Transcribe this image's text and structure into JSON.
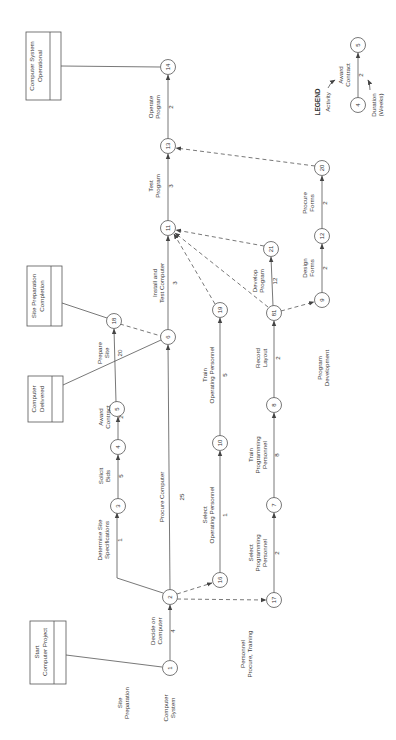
{
  "diagram": {
    "type": "PERT network (rotated 90°)",
    "legend": {
      "title": "LEGEND",
      "activity_label": "Activity",
      "duration_label": "Duration",
      "duration_unit": "(Weeks)",
      "example": {
        "from": "4",
        "to": "5",
        "activity": [
          "Award",
          "Contract"
        ],
        "duration": "2"
      }
    },
    "milestones": [
      {
        "id": "start",
        "lines": [
          "Start",
          "Computer Project"
        ]
      },
      {
        "id": "delivered",
        "lines": [
          "Computer",
          "Delivered"
        ]
      },
      {
        "id": "site-complete",
        "lines": [
          "Site Preparation",
          "Completion"
        ]
      },
      {
        "id": "operational",
        "lines": [
          "Computer System",
          "Operational"
        ]
      }
    ],
    "sections": [
      {
        "id": "computer-system",
        "lines": [
          "Computer",
          "System"
        ]
      },
      {
        "id": "site-preparation",
        "lines": [
          "Site",
          "Preparation"
        ]
      },
      {
        "id": "personnel",
        "lines": [
          "Personnel",
          "Procure, Training"
        ]
      },
      {
        "id": "program-development",
        "lines": [
          "Program",
          "Development"
        ]
      }
    ],
    "nodes": [
      "1",
      "2",
      "3",
      "4",
      "5",
      "6",
      "7",
      "8",
      "9",
      "10",
      "11",
      "12",
      "13",
      "14",
      "16",
      "17",
      "18",
      "19",
      "20",
      "21",
      "81"
    ],
    "activities": [
      {
        "from": "1",
        "to": "2",
        "lines": [
          "Decide on",
          "Computer"
        ],
        "duration": "4"
      },
      {
        "from": "2",
        "to": "3",
        "lines": [
          "Determine Site",
          "Specifications"
        ],
        "duration": "1"
      },
      {
        "from": "3",
        "to": "4",
        "lines": [
          "Solicit",
          "Bids"
        ],
        "duration": "5"
      },
      {
        "from": "4",
        "to": "5",
        "lines": [
          "Award",
          "Contract"
        ],
        "duration": "2"
      },
      {
        "from": "5",
        "to": "18",
        "lines": [
          "Prepare",
          "Site"
        ],
        "duration": "20"
      },
      {
        "from": "2",
        "to": "6",
        "lines": [
          "Procure Computer"
        ],
        "duration": "25"
      },
      {
        "from": "6",
        "to": "11",
        "lines": [
          "Install and",
          "Test Computer"
        ],
        "duration": "3"
      },
      {
        "from": "11",
        "to": "13",
        "lines": [
          "Test",
          "Program"
        ],
        "duration": "3"
      },
      {
        "from": "13",
        "to": "14",
        "lines": [
          "Operate",
          "Program"
        ],
        "duration": "2"
      },
      {
        "from": "16",
        "to": "10",
        "lines": [
          "Select",
          "Operating Personnel"
        ],
        "duration": "1"
      },
      {
        "from": "10",
        "to": "19",
        "lines": [
          "Train",
          "Operating Personnel"
        ],
        "duration": "5"
      },
      {
        "from": "17",
        "to": "7",
        "lines": [
          "Select",
          "Programming",
          "Personnel"
        ],
        "duration": "2"
      },
      {
        "from": "7",
        "to": "8",
        "lines": [
          "Train",
          "Programming",
          "Personnel"
        ],
        "duration": "8"
      },
      {
        "from": "8",
        "to": "81",
        "lines": [
          "Record",
          "Layout"
        ],
        "duration": "2"
      },
      {
        "from": "81",
        "to": "21",
        "lines": [
          "Develop",
          "Program"
        ],
        "duration": "12"
      },
      {
        "from": "9",
        "to": "12",
        "lines": [
          "Design",
          "Forms"
        ],
        "duration": "2"
      },
      {
        "from": "12",
        "to": "20",
        "lines": [
          "Procure",
          "Forms"
        ],
        "duration": "2"
      }
    ],
    "dummies": [
      [
        "2",
        "16"
      ],
      [
        "2",
        "17"
      ],
      [
        "18",
        "6"
      ],
      [
        "19",
        "11"
      ],
      [
        "81",
        "11"
      ],
      [
        "21",
        "11"
      ],
      [
        "81",
        "9"
      ],
      [
        "20",
        "13"
      ]
    ]
  }
}
